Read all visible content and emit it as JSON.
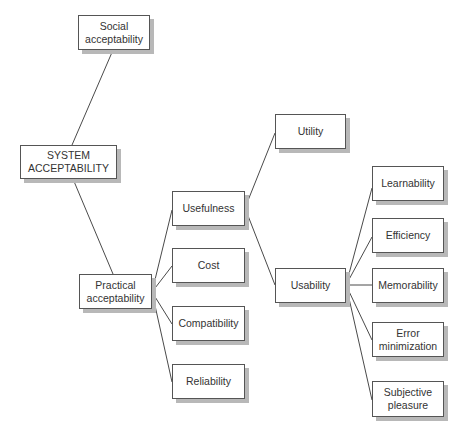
{
  "diagram": {
    "type": "tree",
    "root": "SYSTEM ACCEPTABILITY",
    "nodes": [
      {
        "id": "social",
        "lines": [
          "Social",
          "acceptability"
        ],
        "x": 78,
        "y": 15,
        "w": 72,
        "h": 35
      },
      {
        "id": "system",
        "lines": [
          "SYSTEM",
          "ACCEPTABILITY"
        ],
        "x": 20,
        "y": 145,
        "w": 97,
        "h": 34
      },
      {
        "id": "practical",
        "lines": [
          "Practical",
          "acceptability"
        ],
        "x": 79,
        "y": 274,
        "w": 73,
        "h": 35
      },
      {
        "id": "usefulness",
        "lines": [
          "Usefulness"
        ],
        "x": 172,
        "y": 191,
        "w": 73,
        "h": 35
      },
      {
        "id": "cost",
        "lines": [
          "Cost"
        ],
        "x": 172,
        "y": 248,
        "w": 73,
        "h": 35
      },
      {
        "id": "compatibility",
        "lines": [
          "Compatibility"
        ],
        "x": 172,
        "y": 306,
        "w": 73,
        "h": 35
      },
      {
        "id": "reliability",
        "lines": [
          "Reliability"
        ],
        "x": 172,
        "y": 364,
        "w": 73,
        "h": 35
      },
      {
        "id": "utility",
        "lines": [
          "Utility"
        ],
        "x": 275,
        "y": 114,
        "w": 71,
        "h": 35
      },
      {
        "id": "usability",
        "lines": [
          "Usability"
        ],
        "x": 275,
        "y": 268,
        "w": 71,
        "h": 35
      },
      {
        "id": "learnability",
        "lines": [
          "Learnability"
        ],
        "x": 372,
        "y": 166,
        "w": 72,
        "h": 35
      },
      {
        "id": "efficiency",
        "lines": [
          "Efficiency"
        ],
        "x": 372,
        "y": 218,
        "w": 72,
        "h": 35
      },
      {
        "id": "memorability",
        "lines": [
          "Memorability"
        ],
        "x": 372,
        "y": 268,
        "w": 72,
        "h": 35
      },
      {
        "id": "error",
        "lines": [
          "Error",
          "minimization"
        ],
        "x": 372,
        "y": 322,
        "w": 72,
        "h": 35
      },
      {
        "id": "subjective",
        "lines": [
          "Subjective",
          "pleasure"
        ],
        "x": 372,
        "y": 381,
        "w": 72,
        "h": 36
      }
    ],
    "edges": [
      {
        "from": "system",
        "to": "social",
        "x1": 72,
        "y1": 145,
        "x2": 113,
        "y2": 50
      },
      {
        "from": "system",
        "to": "practical",
        "x1": 73,
        "y1": 179,
        "x2": 113,
        "y2": 274
      },
      {
        "from": "practical",
        "to": "usefulness",
        "x1": 152,
        "y1": 292,
        "x2": 172,
        "y2": 210
      },
      {
        "from": "practical",
        "to": "cost",
        "x1": 152,
        "y1": 292,
        "x2": 172,
        "y2": 266
      },
      {
        "from": "practical",
        "to": "compatibility",
        "x1": 152,
        "y1": 292,
        "x2": 172,
        "y2": 324
      },
      {
        "from": "practical",
        "to": "reliability",
        "x1": 152,
        "y1": 292,
        "x2": 172,
        "y2": 382
      },
      {
        "from": "usefulness",
        "to": "utility",
        "x1": 245,
        "y1": 208,
        "x2": 275,
        "y2": 133
      },
      {
        "from": "usefulness",
        "to": "usability",
        "x1": 245,
        "y1": 208,
        "x2": 275,
        "y2": 285
      },
      {
        "from": "usability",
        "to": "learnability",
        "x1": 346,
        "y1": 285,
        "x2": 372,
        "y2": 188
      },
      {
        "from": "usability",
        "to": "efficiency",
        "x1": 346,
        "y1": 285,
        "x2": 372,
        "y2": 237
      },
      {
        "from": "usability",
        "to": "memorability",
        "x1": 346,
        "y1": 285,
        "x2": 372,
        "y2": 285
      },
      {
        "from": "usability",
        "to": "error",
        "x1": 346,
        "y1": 285,
        "x2": 372,
        "y2": 340
      },
      {
        "from": "usability",
        "to": "subjective",
        "x1": 346,
        "y1": 285,
        "x2": 372,
        "y2": 400
      }
    ]
  },
  "labels": {
    "social": {
      "l1": "Social",
      "l2": "acceptability"
    },
    "system": {
      "l1": "SYSTEM",
      "l2": "ACCEPTABILITY"
    },
    "practical": {
      "l1": "Practical",
      "l2": "acceptability"
    },
    "usefulness": {
      "l1": "Usefulness"
    },
    "cost": {
      "l1": "Cost"
    },
    "compatibility": {
      "l1": "Compatibility"
    },
    "reliability": {
      "l1": "Reliability"
    },
    "utility": {
      "l1": "Utility"
    },
    "usability": {
      "l1": "Usability"
    },
    "learnability": {
      "l1": "Learnability"
    },
    "efficiency": {
      "l1": "Efficiency"
    },
    "memorability": {
      "l1": "Memorability"
    },
    "error": {
      "l1": "Error",
      "l2": "minimization"
    },
    "subjective": {
      "l1": "Subjective",
      "l2": "pleasure"
    }
  },
  "colors": {
    "line": "#4a4a4a",
    "box_border": "#555555",
    "box_shadow": "#b8b8b8",
    "text": "#333333",
    "background": "#ffffff"
  }
}
